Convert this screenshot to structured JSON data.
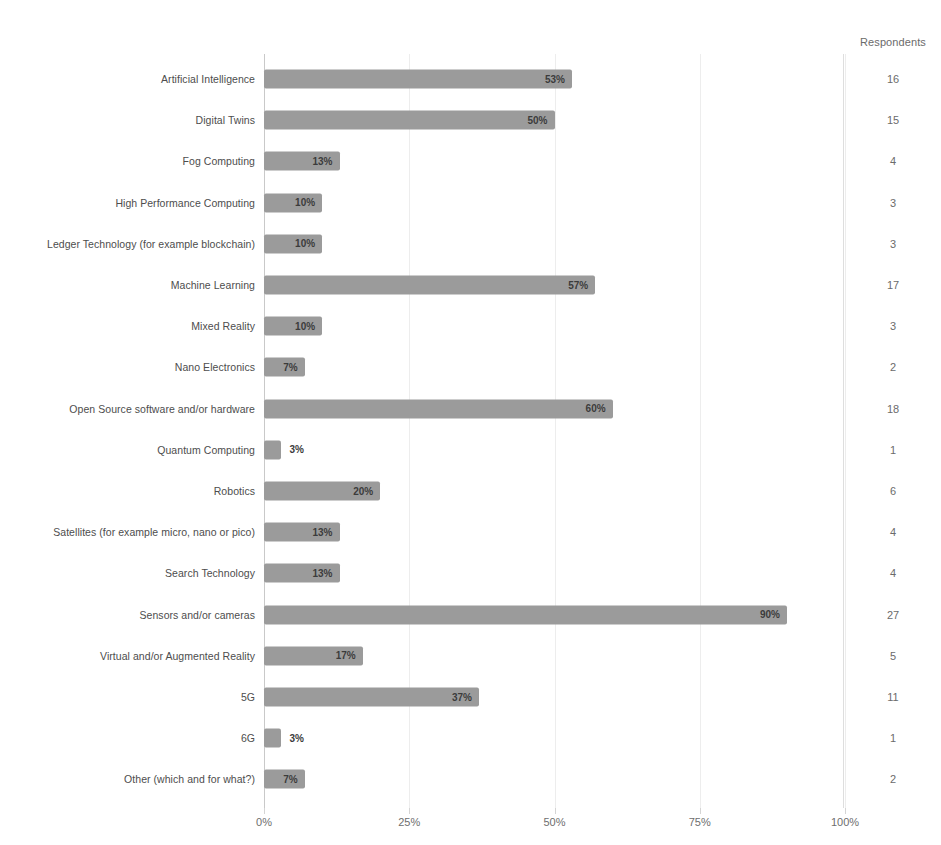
{
  "axis": {
    "respondents_header": "Respondents",
    "tick_labels": [
      "0%",
      "25%",
      "50%",
      "75%",
      "100%"
    ]
  },
  "chart_data": {
    "type": "bar",
    "orientation": "horizontal",
    "title": "",
    "xlabel": "",
    "ylabel": "",
    "xlim": [
      0,
      100
    ],
    "xticks": [
      0,
      25,
      50,
      75,
      100
    ],
    "xtick_labels": [
      "0%",
      "25%",
      "50%",
      "75%",
      "100%"
    ],
    "grid": true,
    "legend": false,
    "bar_color": "#9b9b9b",
    "value_suffix": "%",
    "secondary_column_label": "Respondents",
    "categories": [
      "Artificial Intelligence",
      "Digital Twins",
      "Fog Computing",
      "High Performance Computing",
      "Ledger Technology (for example blockchain)",
      "Machine Learning",
      "Mixed Reality",
      "Nano Electronics",
      "Open Source software and/or hardware",
      "Quantum Computing",
      "Robotics",
      "Satellites (for example micro, nano or pico)",
      "Search Technology",
      "Sensors and/or cameras",
      "Virtual and/or Augmented Reality",
      "5G",
      "6G",
      "Other (which and for what?)"
    ],
    "values": [
      53,
      50,
      13,
      10,
      10,
      57,
      10,
      7,
      60,
      3,
      20,
      13,
      13,
      90,
      17,
      37,
      3,
      7
    ],
    "value_labels": [
      "53%",
      "50%",
      "13%",
      "10%",
      "10%",
      "57%",
      "10%",
      "7%",
      "60%",
      "3%",
      "20%",
      "13%",
      "13%",
      "90%",
      "17%",
      "37%",
      "3%",
      "7%"
    ],
    "respondents": [
      16,
      15,
      4,
      3,
      3,
      17,
      3,
      2,
      18,
      1,
      6,
      4,
      4,
      27,
      5,
      11,
      1,
      2
    ]
  }
}
